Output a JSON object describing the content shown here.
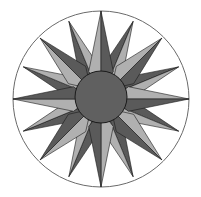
{
  "figure": {
    "center": [
      101,
      99
    ],
    "outer_radius": 88,
    "inner_radius": 26,
    "colors": {
      "background": "#ffffff",
      "ring_stroke": "#6a6a6a",
      "dark": "#5a5a5a",
      "light": "#b0b0b0",
      "mid": "#7d7d7d",
      "disc": "#606060",
      "outline": "#1a1a1a"
    },
    "points": {
      "cardinal": {
        "count": 4,
        "length": 88,
        "half_width_deg": 11
      },
      "intercardinal": {
        "count": 4,
        "length": 86,
        "half_width_deg": 9
      },
      "secondary": {
        "count": 8,
        "length": 84,
        "half_width_deg": 6
      }
    }
  }
}
